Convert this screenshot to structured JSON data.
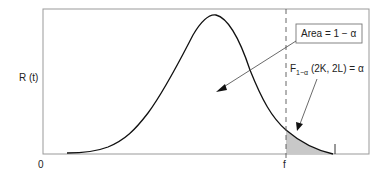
{
  "diagram": {
    "y_axis_label": "R (t)",
    "origin_label": "0",
    "critical_value_label": "f",
    "area_box_label": "Area = 1 − α",
    "tail_label_prefix": "F",
    "tail_label_subscript": "1−α",
    "tail_label_suffix": " (2K, 2L) = α",
    "colors": {
      "frame": "#999999",
      "curve": "#111111",
      "shade": "#c8c8c8"
    }
  }
}
